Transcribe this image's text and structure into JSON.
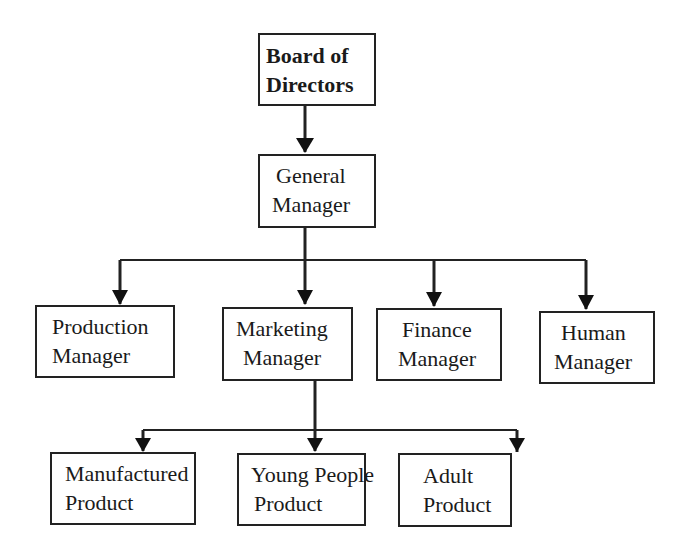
{
  "diagram": {
    "type": "org-chart",
    "nodes": {
      "board": {
        "line1": "Board of",
        "line2": "Directors"
      },
      "general": {
        "line1": "General",
        "line2": "Manager"
      },
      "production": {
        "line1": "Production",
        "line2": "Manager"
      },
      "marketing": {
        "line1": "Marketing",
        "line2": "Manager"
      },
      "finance": {
        "line1": "Finance",
        "line2": "Manager"
      },
      "human": {
        "line1": "Human",
        "line2": "Manager"
      },
      "manufactured": {
        "line1": "Manufactured",
        "line2": "Product"
      },
      "young": {
        "line1": "Young People",
        "line2": "Product"
      },
      "adult": {
        "line1": "Adult",
        "line2": "Product"
      }
    },
    "edges": [
      [
        "board",
        "general"
      ],
      [
        "general",
        "production"
      ],
      [
        "general",
        "marketing"
      ],
      [
        "general",
        "finance"
      ],
      [
        "general",
        "human"
      ],
      [
        "marketing",
        "manufactured"
      ],
      [
        "marketing",
        "young"
      ],
      [
        "marketing",
        "adult"
      ]
    ]
  }
}
